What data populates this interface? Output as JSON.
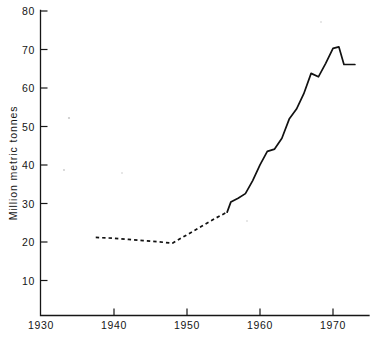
{
  "chart_data": {
    "type": "line",
    "title": "",
    "subtitle": "",
    "xlabel": "",
    "ylabel": "Million metric tonnes",
    "xlim": [
      1930,
      1974
    ],
    "ylim": [
      0.9,
      80
    ],
    "xticks": [
      1930,
      1940,
      1950,
      1960,
      1970
    ],
    "xtick_labels": [
      "1930",
      "1940",
      "1950",
      "1960",
      "1970"
    ],
    "yticks": [
      10,
      20,
      30,
      40,
      50,
      60,
      70,
      80
    ],
    "ytick_labels": [
      "10",
      "20",
      "30",
      "40",
      "50",
      "60",
      "70",
      "80"
    ],
    "grid": false,
    "legend": null,
    "annotations": [],
    "series": [
      {
        "name": "Estimated (dashed)",
        "style": "dashed",
        "x": [
          1937.5,
          1940,
          1942,
          1944,
          1946,
          1948,
          1950,
          1952,
          1954,
          1955.5
        ],
        "values": [
          21.2,
          21.0,
          20.7,
          20.4,
          20.1,
          19.7,
          21.9,
          24.1,
          26.3,
          27.8
        ]
      },
      {
        "name": "Observed (solid)",
        "style": "solid",
        "x": [
          1955.5,
          1956,
          1957,
          1958,
          1959,
          1960,
          1961,
          1962,
          1963,
          1964,
          1965,
          1966,
          1967,
          1968,
          1969,
          1970,
          1970.8,
          1971.5,
          1972,
          1973
        ],
        "values": [
          27.8,
          30.4,
          31.4,
          32.6,
          36.0,
          40.1,
          43.6,
          44.2,
          47.0,
          52.0,
          54.6,
          58.6,
          63.9,
          63.0,
          66.5,
          70.4,
          70.8,
          66.2,
          66.2,
          66.2
        ]
      }
    ]
  }
}
